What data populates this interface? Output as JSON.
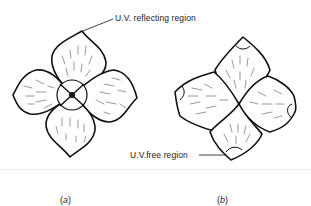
{
  "figure": {
    "panels": [
      {
        "id": "a",
        "caption": "(a)",
        "caption_letter": "a",
        "description": "Four-petalled flower, central circular region and dark center"
      },
      {
        "id": "b",
        "caption": "(b)",
        "caption_letter": "b",
        "description": "Four-petalled flower with small distinct regions at petal tips"
      }
    ],
    "annotations": {
      "uv_reflecting": "U.V. reflecting region",
      "uv_free": "U.V.free region"
    },
    "colors": {
      "ink": "#111111",
      "background": "#ffffff",
      "hatch": "#555555"
    }
  }
}
